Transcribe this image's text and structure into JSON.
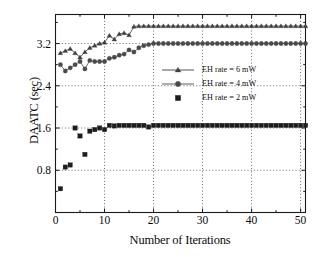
{
  "chart_data": {
    "type": "scatter",
    "title": "",
    "xlabel": "Number of Iterations",
    "ylabel": "DAATC (sec)",
    "xlim": [
      0,
      51
    ],
    "ylim": [
      0.0,
      3.75
    ],
    "xticks": [
      0,
      10,
      20,
      30,
      40,
      50
    ],
    "yticks": [
      0.8,
      1.6,
      2.4,
      3.2
    ],
    "xtick_labels": [
      "0",
      "10",
      "20",
      "30",
      "40",
      "50"
    ],
    "ytick_labels": [
      "0.8",
      "1.6",
      "2.4",
      "3.2"
    ],
    "grid": "dotted-both",
    "legend_position": "center-right",
    "marker_color": "#3a3a3a",
    "axis_color": "#1a1a1a",
    "grid_color": "#555555",
    "series": [
      {
        "name": "EH rate = 6 mW",
        "marker": "triangle",
        "color": "#3f3f3f",
        "x": [
          1,
          2,
          3,
          4,
          5,
          6,
          7,
          8,
          9,
          10,
          11,
          12,
          13,
          14,
          15,
          16,
          17,
          18,
          19,
          20,
          21,
          22,
          23,
          24,
          25,
          26,
          27,
          28,
          29,
          30,
          31,
          32,
          33,
          34,
          35,
          36,
          37,
          38,
          39,
          40,
          41,
          42,
          43,
          44,
          45,
          46,
          47,
          48,
          49,
          50,
          51
        ],
        "values": [
          3.02,
          3.06,
          3.1,
          3.02,
          2.94,
          3.04,
          3.12,
          3.16,
          3.2,
          3.22,
          3.35,
          3.28,
          3.38,
          3.4,
          3.36,
          3.52,
          3.53,
          3.53,
          3.53,
          3.53,
          3.53,
          3.53,
          3.53,
          3.53,
          3.53,
          3.53,
          3.53,
          3.53,
          3.53,
          3.53,
          3.53,
          3.53,
          3.53,
          3.53,
          3.53,
          3.53,
          3.53,
          3.53,
          3.53,
          3.53,
          3.53,
          3.53,
          3.53,
          3.53,
          3.53,
          3.53,
          3.53,
          3.53,
          3.53,
          3.53,
          3.53
        ]
      },
      {
        "name": "EH rate = 4 mW",
        "marker": "circle",
        "color": "#4a4a4a",
        "x": [
          1,
          2,
          3,
          4,
          5,
          6,
          7,
          8,
          9,
          10,
          11,
          12,
          13,
          14,
          15,
          16,
          17,
          18,
          19,
          20,
          21,
          22,
          23,
          24,
          25,
          26,
          27,
          28,
          29,
          30,
          31,
          32,
          33,
          34,
          35,
          36,
          37,
          38,
          39,
          40,
          41,
          42,
          43,
          44,
          45,
          46,
          47,
          48,
          49,
          50,
          51
        ],
        "values": [
          2.8,
          2.68,
          2.74,
          2.8,
          2.86,
          2.72,
          2.88,
          2.86,
          2.86,
          2.86,
          2.92,
          2.94,
          2.98,
          3.0,
          3.08,
          3.04,
          3.12,
          3.16,
          3.18,
          3.2,
          3.2,
          3.2,
          3.2,
          3.2,
          3.2,
          3.2,
          3.2,
          3.2,
          3.2,
          3.2,
          3.2,
          3.2,
          3.2,
          3.2,
          3.2,
          3.2,
          3.2,
          3.2,
          3.2,
          3.2,
          3.2,
          3.2,
          3.2,
          3.2,
          3.2,
          3.2,
          3.2,
          3.2,
          3.2,
          3.2,
          3.2
        ]
      },
      {
        "name": "EH rate = 2 mW",
        "marker": "square",
        "color": "#1c1c1c",
        "x": [
          1,
          2,
          3,
          4,
          5,
          6,
          7,
          8,
          9,
          10,
          11,
          12,
          13,
          14,
          15,
          16,
          17,
          18,
          19,
          20,
          21,
          22,
          23,
          24,
          25,
          26,
          27,
          28,
          29,
          30,
          31,
          32,
          33,
          34,
          35,
          36,
          37,
          38,
          39,
          40,
          41,
          42,
          43,
          44,
          45,
          46,
          47,
          48,
          49,
          50,
          51
        ],
        "values": [
          0.45,
          0.86,
          0.9,
          1.6,
          1.45,
          1.1,
          1.54,
          1.57,
          1.6,
          1.57,
          1.65,
          1.64,
          1.65,
          1.65,
          1.65,
          1.65,
          1.65,
          1.65,
          1.62,
          1.65,
          1.65,
          1.65,
          1.65,
          1.65,
          1.65,
          1.65,
          1.65,
          1.65,
          1.65,
          1.65,
          1.65,
          1.65,
          1.65,
          1.65,
          1.65,
          1.65,
          1.65,
          1.65,
          1.65,
          1.65,
          1.65,
          1.65,
          1.65,
          1.65,
          1.65,
          1.65,
          1.65,
          1.65,
          1.65,
          1.65,
          1.65
        ]
      }
    ],
    "legend": [
      {
        "label": "EH rate = 6 mW",
        "marker": "triangle"
      },
      {
        "label": "EH rate = 4 mW",
        "marker": "circle"
      },
      {
        "label": "EH rate = 2 mW",
        "marker": "square"
      }
    ]
  }
}
